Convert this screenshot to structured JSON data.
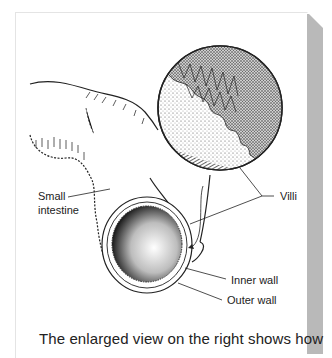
{
  "figure": {
    "labels": {
      "small_intestine_line1": "Small",
      "small_intestine_line2": "intestine",
      "villi": "Villi",
      "inner_wall": "Inner wall",
      "outer_wall": "Outer wall"
    },
    "caption": "The enlarged view on the right shows how"
  },
  "colors": {
    "background": "#ffffff",
    "side_panel": "#b9b9b9",
    "ink": "#222222"
  }
}
